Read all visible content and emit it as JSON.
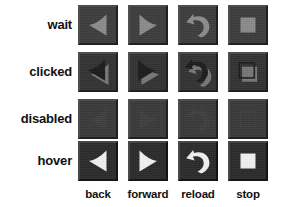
{
  "figure": {
    "kind": "button-state-matrix",
    "background_color": "#ffffff"
  },
  "rows": [
    {
      "key": "wait",
      "label": "wait",
      "icon_color": "#8c8c8c",
      "icon_style": "flat-gray"
    },
    {
      "key": "clicked",
      "label": "clicked",
      "icon_color": "#1c1c1c",
      "icon_style": "pressed-embossed"
    },
    {
      "key": "disabled",
      "label": "disabled",
      "icon_color": "#3f3f3f",
      "icon_style": "blank"
    },
    {
      "key": "hover",
      "label": "hover",
      "icon_color": "#f2f2f2",
      "icon_style": "bright-white"
    }
  ],
  "columns": [
    {
      "key": "back",
      "label": "back",
      "icon": "arrow-left-icon"
    },
    {
      "key": "forward",
      "label": "forward",
      "icon": "arrow-right-icon"
    },
    {
      "key": "reload",
      "label": "reload",
      "icon": "reload-curved-arrow-icon"
    },
    {
      "key": "stop",
      "label": "stop",
      "icon": "stop-square-icon"
    }
  ],
  "colors": {
    "button_face": "#3a3a3a",
    "button_highlight": "#4e4e4e",
    "button_shadow": "#202020",
    "label_text": "#111111",
    "icon_wait": "#8c8c8c",
    "icon_clicked_dark": "#1c1c1c",
    "icon_clicked_light": "#787878",
    "icon_disabled": "#3f3f3f",
    "icon_hover": "#f2f2f2"
  },
  "geometry": {
    "cell_size": 40,
    "col_x": [
      78,
      128,
      178,
      228
    ],
    "row_y": [
      5,
      52,
      99,
      141
    ],
    "label_col_width": 72,
    "col_label_y": 188
  }
}
